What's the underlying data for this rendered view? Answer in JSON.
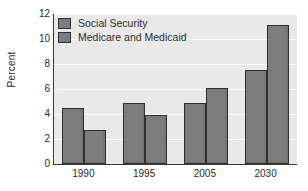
{
  "chart_data": {
    "type": "bar",
    "title": "",
    "xlabel": "",
    "ylabel": "Percent",
    "categories": [
      "1990",
      "1995",
      "2005",
      "2030"
    ],
    "series": [
      {
        "name": "Social Security",
        "values": [
          4.5,
          4.85,
          4.9,
          7.5
        ],
        "color": "#7d7d7d"
      },
      {
        "name": "Medicare and Medicaid",
        "values": [
          2.7,
          3.9,
          6.1,
          11.1
        ],
        "color": "#7d7d7d"
      }
    ],
    "ylim": [
      0,
      12
    ],
    "yticks": [
      "0",
      "2",
      "4",
      "6",
      "8",
      "10",
      "12"
    ],
    "ytick_values": [
      0,
      2,
      4,
      6,
      8,
      10,
      12
    ],
    "grid": true,
    "legend_position": "top-left",
    "plot_background": "#e9e9e9",
    "figure_background": "#ffffff",
    "gridline_color": "#fdfdfd",
    "axis_color": "#3a3a3a",
    "bar_edge_color": "#2f2f2f"
  }
}
